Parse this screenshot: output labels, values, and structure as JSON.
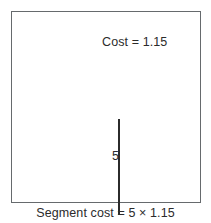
{
  "figure": {
    "box": {
      "name": "diagram-frame"
    },
    "segment": {
      "name": "vertical-segment",
      "length_label": "5"
    },
    "labels": {
      "cost": "Cost = 1.15",
      "length": "5"
    },
    "caption": "Segment cost = 5 × 1.15"
  },
  "colors": {
    "border": "#666a6d",
    "segment": "#2b2b2b",
    "text": "#2b2b2b",
    "background": "#ffffff"
  }
}
